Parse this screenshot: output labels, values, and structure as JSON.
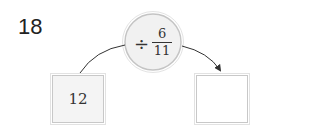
{
  "question": {
    "number": "18"
  },
  "operation": {
    "sign": "÷",
    "fraction": {
      "numerator": "6",
      "denominator": "11"
    }
  },
  "input_box": {
    "value": "12"
  },
  "output_box": {
    "value": ""
  },
  "colors": {
    "circle_fill": "#f1f1f1",
    "circle_stroke": "#c8c8c8",
    "box_fill": "#f4f4f4",
    "arrow": "#333333"
  }
}
